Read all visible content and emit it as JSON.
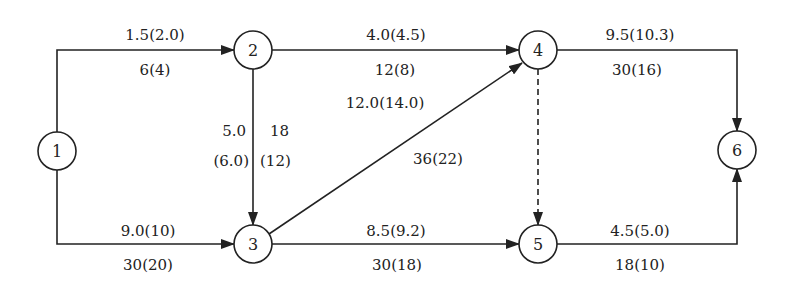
{
  "diagram": {
    "type": "activity-on-arrow network",
    "nodes": [
      {
        "id": "1",
        "label": "1",
        "x": 57,
        "y": 151
      },
      {
        "id": "2",
        "label": "2",
        "x": 253,
        "y": 50
      },
      {
        "id": "3",
        "label": "3",
        "x": 253,
        "y": 244
      },
      {
        "id": "4",
        "label": "4",
        "x": 538,
        "y": 50
      },
      {
        "id": "5",
        "label": "5",
        "x": 538,
        "y": 244
      },
      {
        "id": "6",
        "label": "6",
        "x": 737,
        "y": 150
      }
    ],
    "edges": [
      {
        "from": "1",
        "to": "2",
        "top": "1.5(2.0)",
        "bottom": "6(4)",
        "style": "solid"
      },
      {
        "from": "1",
        "to": "3",
        "top": "9.0(10)",
        "bottom": "30(20)",
        "style": "solid"
      },
      {
        "from": "2",
        "to": "3",
        "left_top": "5.0",
        "left_bottom": "(6.0)",
        "right_top": "18",
        "right_bottom": "(12)",
        "style": "solid"
      },
      {
        "from": "2",
        "to": "4",
        "top": "4.0(4.5)",
        "bottom": "12(8)",
        "style": "solid"
      },
      {
        "from": "3",
        "to": "4",
        "top": "12.0(14.0)",
        "bottom": "36(22)",
        "style": "solid"
      },
      {
        "from": "3",
        "to": "5",
        "top": "8.5(9.2)",
        "bottom": "30(18)",
        "style": "solid"
      },
      {
        "from": "4",
        "to": "5",
        "style": "dashed"
      },
      {
        "from": "4",
        "to": "6",
        "top": "9.5(10.3)",
        "bottom": "30(16)",
        "style": "solid"
      },
      {
        "from": "5",
        "to": "6",
        "top": "4.5(5.0)",
        "bottom": "18(10)",
        "style": "solid"
      }
    ]
  },
  "colors": {
    "stroke": "#222222",
    "background": "#ffffff"
  }
}
